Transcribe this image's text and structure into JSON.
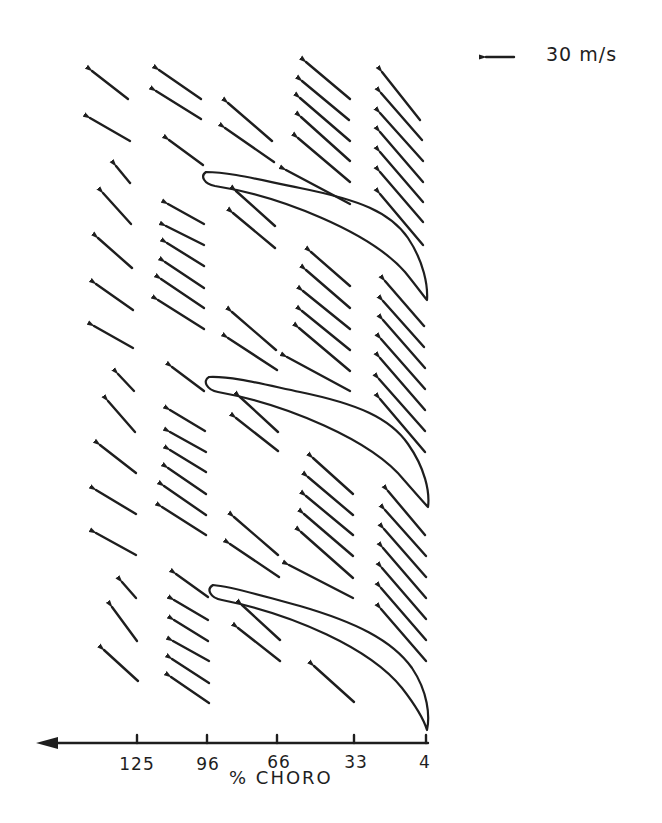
{
  "figure": {
    "type": "velocity-vector-field",
    "scale": {
      "label": "30 m/s",
      "arrow_length_px": 28
    },
    "x_axis": {
      "title": "% CHORO",
      "direction": "right-to-left",
      "ticks": [
        {
          "label": "125",
          "x": 137
        },
        {
          "label": "96",
          "x": 207
        },
        {
          "label": "66",
          "x": 277
        },
        {
          "label": "33",
          "x": 354
        },
        {
          "label": "4",
          "x": 425
        }
      ]
    },
    "stroke_color": "#1e1e1e",
    "background_color": "#ffffff",
    "blade_count": 3,
    "vector_columns": [
      {
        "station": "125",
        "x": 118
      },
      {
        "station": "96",
        "x": 185
      },
      {
        "station": "66",
        "x": 250
      },
      {
        "station": "33",
        "x": 328
      },
      {
        "station": "4",
        "x": 405
      }
    ]
  }
}
